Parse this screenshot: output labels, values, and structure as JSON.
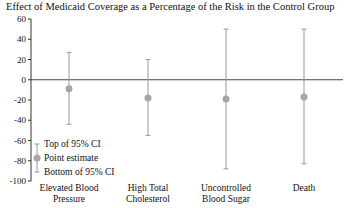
{
  "chart_data": {
    "type": "scatter",
    "subtype": "point-estimate-with-error-bars",
    "title": "Effect of Medicaid Coverage as a Percentage of the Risk in the Control Group",
    "xlabel": "",
    "ylabel": "",
    "ylim": [
      -100,
      60
    ],
    "yticks": [
      60,
      40,
      20,
      0,
      -20,
      -40,
      -60,
      -80,
      -100
    ],
    "grid": false,
    "categories": [
      "Elevated Blood Pressure",
      "High Total Cholesterol",
      "Uncontrolled Blood Sugar",
      "Death"
    ],
    "series": [
      {
        "name": "Point estimate",
        "values": [
          -9,
          -18,
          -19,
          -17
        ]
      },
      {
        "name": "Top of 95% CI",
        "values": [
          27,
          20,
          50,
          50
        ]
      },
      {
        "name": "Bottom of 95% CI",
        "values": [
          -44,
          -55,
          -88,
          -83
        ]
      }
    ],
    "legend": {
      "position": "lower-left-inside",
      "entries": [
        "Top of 95% CI",
        "Point estimate",
        "Bottom of 95% CI"
      ]
    },
    "colors": {
      "error_bar": "#999999",
      "point": "#a6a6a6",
      "axis": "#333333"
    }
  },
  "title": "Effect of Medicaid Coverage as a Percentage of the Risk in the Control Group",
  "categories": [
    {
      "line1": "Elevated Blood",
      "line2": "Pressure"
    },
    {
      "line1": "High Total",
      "line2": "Cholesterol"
    },
    {
      "line1": "Uncontrolled",
      "line2": "Blood Sugar"
    },
    {
      "line1": "Death",
      "line2": ""
    }
  ],
  "yticks": [
    "60",
    "40",
    "20",
    "0",
    "-20",
    "-40",
    "-60",
    "-80",
    "-100"
  ],
  "legend": {
    "top": "Top of 95% CI",
    "point": "Point estimate",
    "bottom": "Bottom of 95% CI"
  }
}
